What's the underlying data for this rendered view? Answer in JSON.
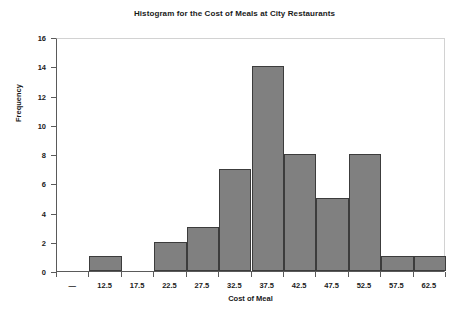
{
  "chart_data": {
    "type": "bar",
    "title": "Histogram for the Cost of Meals at City Restaurants",
    "xlabel": "Cost of Meal",
    "ylabel": "Frequency",
    "categories": [
      "—",
      "12.5",
      "17.5",
      "22.5",
      "27.5",
      "32.5",
      "37.5",
      "42.5",
      "47.5",
      "52.5",
      "57.5",
      "62.5"
    ],
    "values": [
      0,
      1,
      0,
      2,
      3,
      7,
      14,
      8,
      5,
      8,
      1,
      1
    ],
    "ylim": [
      0,
      16
    ],
    "y_ticks": [
      0,
      2,
      4,
      6,
      8,
      10,
      12,
      14,
      16
    ],
    "y_tick_labels": [
      "0",
      "2",
      "4",
      "6",
      "8",
      "10",
      "12",
      "14",
      "16"
    ],
    "grid": false,
    "legend": "none",
    "bar_color": "#808080",
    "bar_edge_color": "#3c3c3c",
    "axis_color": "#5a5a5a",
    "frame_color": "#d2d2d2",
    "background_color": "#ffffff"
  }
}
